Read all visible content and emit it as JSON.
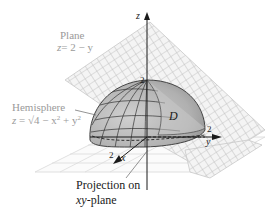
{
  "figure": {
    "type": "3d-surface-diagram",
    "plane": {
      "label": "Plane",
      "equation_lhs": "z",
      "equation_rhs": "= 2 − y",
      "color": "#bdbdbd"
    },
    "hemisphere": {
      "label": "Hemisphere",
      "equation_lhs": "z",
      "equation_eq": " = √4 − x",
      "equation_sup1": "2",
      "equation_mid": " + y",
      "equation_sup2": "2",
      "fill_color": "#b5b5b5",
      "grid_color": "#3a3a3a"
    },
    "projection": {
      "line1": "Projection on",
      "line2_italic": "xy",
      "line2_rest": "-plane"
    },
    "region_label": "D",
    "axes": {
      "z": {
        "label": "z",
        "tick": "2"
      },
      "y": {
        "label": "y",
        "tick": "2"
      },
      "x": {
        "label": "x",
        "tick": "2"
      }
    },
    "colors": {
      "label_gray": "#9a9a9a",
      "label_dark": "#1a1a1a",
      "axis": "#1a1a1a"
    }
  }
}
